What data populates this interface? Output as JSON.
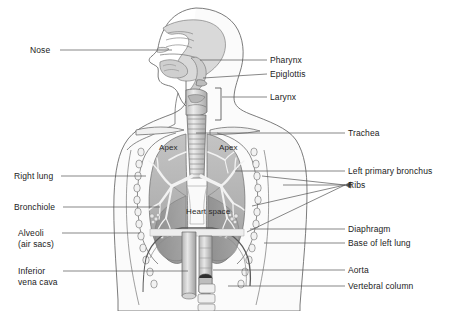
{
  "figure": {
    "background_color": "#ffffff",
    "width": 449,
    "height": 311
  },
  "colors": {
    "line": "#4a4a4a",
    "leader": "#555555",
    "text": "#1b1b1b",
    "body_fill": "#f4f4f4",
    "lung_fill": "#b8b8b8",
    "lung_dark": "#8e8e8e",
    "airway_fill": "#d8d8d8",
    "vessel_fill": "#cfcfcf",
    "vessel_dark": "#6f6f6f",
    "skin_fill": "#fbfbfb"
  },
  "labels_left": [
    {
      "id": "nose",
      "text": "Nose",
      "x": 30,
      "y": 45,
      "leader": {
        "x1": 60,
        "y1": 50,
        "x2": 172,
        "y2": 50
      }
    },
    {
      "id": "right-lung",
      "text": "Right lung",
      "x": 14,
      "y": 171,
      "leader": {
        "x1": 61,
        "y1": 176,
        "x2": 146,
        "y2": 176
      }
    },
    {
      "id": "bronchiole",
      "text": "Bronchiole",
      "x": 14,
      "y": 202,
      "leader": {
        "x1": 63,
        "y1": 207,
        "x2": 160,
        "y2": 207
      }
    },
    {
      "id": "alveoli",
      "text": "Alveoli\n(air sacs)",
      "x": 18,
      "y": 228,
      "leader": {
        "x1": 62,
        "y1": 233,
        "x2": 140,
        "y2": 233
      }
    },
    {
      "id": "inferior-vena-cava",
      "text": "Inferior\nvena cava",
      "x": 18,
      "y": 266,
      "leader": {
        "x1": 63,
        "y1": 271,
        "x2": 188,
        "y2": 271
      }
    }
  ],
  "labels_right": [
    {
      "id": "pharynx",
      "text": "Pharynx",
      "x": 270,
      "y": 55,
      "leader": {
        "x1": 267,
        "y1": 60,
        "x2": 200,
        "y2": 60
      }
    },
    {
      "id": "epiglottis",
      "text": "Epiglottis",
      "x": 270,
      "y": 69,
      "leader": {
        "x1": 267,
        "y1": 74,
        "x2": 203,
        "y2": 78
      }
    },
    {
      "id": "larynx",
      "text": "Larynx",
      "x": 270,
      "y": 92,
      "leader": {
        "x1": 267,
        "y1": 97,
        "x2": 222,
        "y2": 97
      }
    },
    {
      "id": "trachea",
      "text": "Trachea",
      "x": 348,
      "y": 128,
      "leader": {
        "x1": 345,
        "y1": 133,
        "x2": 196,
        "y2": 133
      }
    },
    {
      "id": "left-primary-bronchus",
      "text": "Left primary bronchus",
      "x": 348,
      "y": 166,
      "leader": {
        "x1": 345,
        "y1": 171,
        "x2": 235,
        "y2": 171
      }
    },
    {
      "id": "ribs",
      "text": "Ribs",
      "x": 348,
      "y": 180,
      "leader": {
        "x1": 345,
        "y1": 185,
        "x2": 283,
        "y2": 185
      }
    },
    {
      "id": "diaphragm",
      "text": "Diaphragm",
      "x": 348,
      "y": 224,
      "leader": {
        "x1": 345,
        "y1": 229,
        "x2": 250,
        "y2": 229
      }
    },
    {
      "id": "base-of-left-lung",
      "text": "Base of left lung",
      "x": 348,
      "y": 238,
      "leader": {
        "x1": 345,
        "y1": 243,
        "x2": 264,
        "y2": 243
      }
    },
    {
      "id": "aorta",
      "text": "Aorta",
      "x": 348,
      "y": 265,
      "leader": {
        "x1": 345,
        "y1": 270,
        "x2": 213,
        "y2": 270
      }
    },
    {
      "id": "vertebral-column",
      "text": "Vertebral column",
      "x": 348,
      "y": 281,
      "leader": {
        "x1": 345,
        "y1": 286,
        "x2": 228,
        "y2": 286
      }
    }
  ],
  "labels_inline": [
    {
      "id": "apex-right",
      "text": "Apex",
      "x": 159,
      "y": 143
    },
    {
      "id": "apex-left",
      "text": "Apex",
      "x": 219,
      "y": 143
    },
    {
      "id": "heart-space",
      "text": "Heart space",
      "x": 186,
      "y": 207
    }
  ]
}
